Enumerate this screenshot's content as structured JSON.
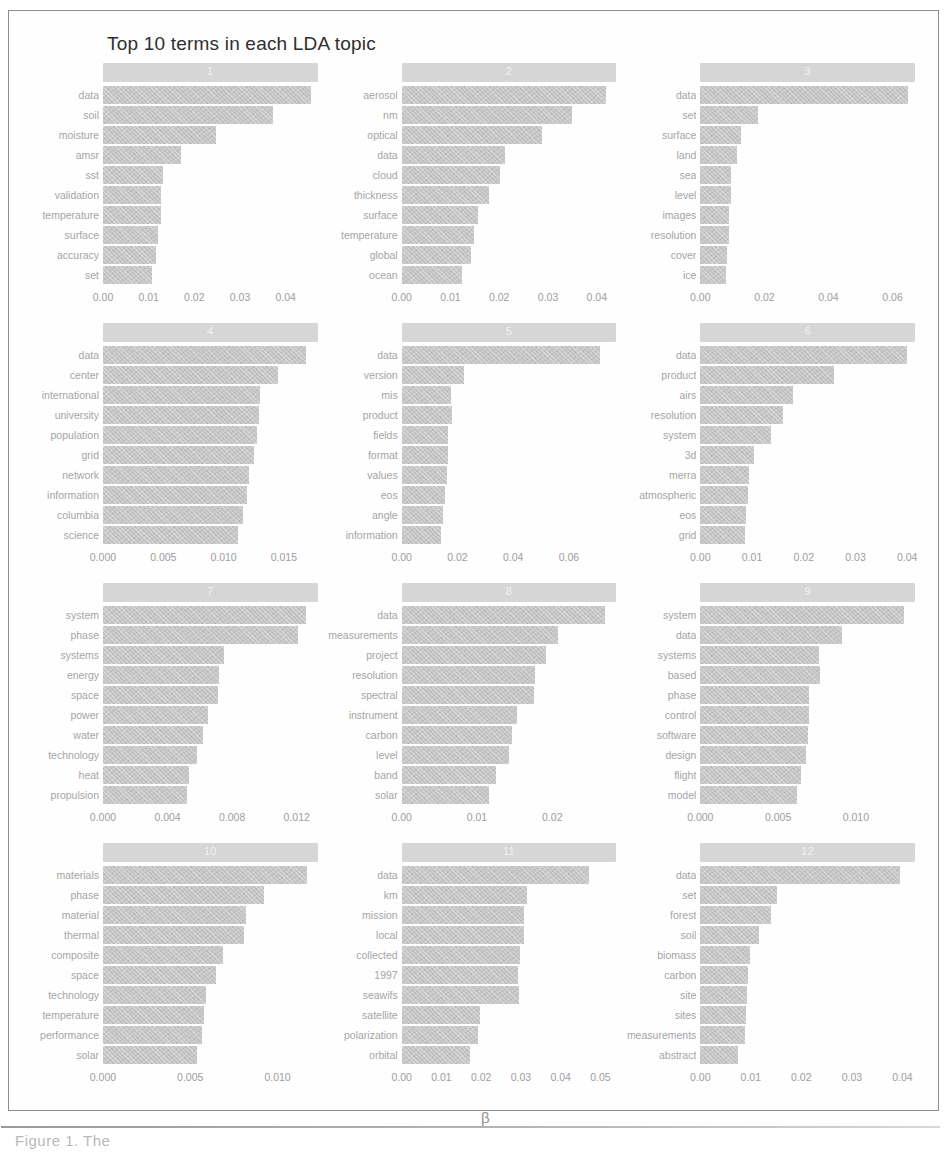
{
  "figure": {
    "title": "Top 10 terms in each LDA topic",
    "x_axis_label": "β",
    "caption_fragment": "Figure 1. The",
    "bar_color": "#c6c6c6",
    "strip_color": "#d6d6d6",
    "text_color": "#a5a5a5",
    "frame_color": "#8d8d8d"
  },
  "chart_data": {
    "type": "bar",
    "title": "Top 10 terms in each LDA topic",
    "xlabel": "β",
    "ylabel": "",
    "orientation": "horizontal",
    "grid": false,
    "legend": "none",
    "facets": [
      {
        "topic": "1",
        "xlim": [
          0,
          0.047
        ],
        "ticks": [
          "0.00",
          "0.01",
          "0.02",
          "0.03",
          "0.04"
        ],
        "tick_values": [
          0.0,
          0.01,
          0.02,
          0.03,
          0.04
        ],
        "categories": [
          "data",
          "soil",
          "moisture",
          "amsr",
          "sst",
          "validation",
          "temperature",
          "surface",
          "accuracy",
          "set"
        ],
        "values": [
          0.0455,
          0.0372,
          0.0248,
          0.017,
          0.0131,
          0.0128,
          0.0127,
          0.0121,
          0.0115,
          0.0107
        ]
      },
      {
        "topic": "2",
        "xlim": [
          0,
          0.044
        ],
        "ticks": [
          "0.00",
          "0.01",
          "0.02",
          "0.03",
          "0.04"
        ],
        "tick_values": [
          0.0,
          0.01,
          0.02,
          0.03,
          0.04
        ],
        "categories": [
          "aerosol",
          "nm",
          "optical",
          "data",
          "cloud",
          "thickness",
          "surface",
          "temperature",
          "global",
          "ocean"
        ],
        "values": [
          0.0418,
          0.0349,
          0.0288,
          0.0212,
          0.0202,
          0.0178,
          0.0156,
          0.0148,
          0.0143,
          0.0123
        ]
      },
      {
        "topic": "3",
        "xlim": [
          0,
          0.067
        ],
        "ticks": [
          "0.00",
          "0.02",
          "0.04",
          "0.06"
        ],
        "tick_values": [
          0.0,
          0.02,
          0.04,
          0.06
        ],
        "categories": [
          "data",
          "set",
          "surface",
          "land",
          "sea",
          "level",
          "images",
          "resolution",
          "cover",
          "ice"
        ],
        "values": [
          0.0648,
          0.018,
          0.0128,
          0.0116,
          0.0097,
          0.0095,
          0.0089,
          0.0089,
          0.0082,
          0.008
        ]
      },
      {
        "topic": "4",
        "xlim": [
          0,
          0.0178
        ],
        "ticks": [
          "0.000",
          "0.005",
          "0.010",
          "0.015"
        ],
        "tick_values": [
          0.0,
          0.005,
          0.01,
          0.015
        ],
        "categories": [
          "data",
          "center",
          "international",
          "university",
          "population",
          "grid",
          "network",
          "information",
          "columbia",
          "science"
        ],
        "values": [
          0.0168,
          0.0145,
          0.013,
          0.0129,
          0.0128,
          0.0125,
          0.0121,
          0.0119,
          0.0116,
          0.0112
        ]
      },
      {
        "topic": "5",
        "xlim": [
          0,
          0.077
        ],
        "ticks": [
          "0.00",
          "0.02",
          "0.04",
          "0.06"
        ],
        "tick_values": [
          0.0,
          0.02,
          0.04,
          0.06
        ],
        "categories": [
          "data",
          "version",
          "mis",
          "product",
          "fields",
          "format",
          "values",
          "eos",
          "angle",
          "information"
        ],
        "values": [
          0.0712,
          0.0222,
          0.0177,
          0.0181,
          0.0167,
          0.0165,
          0.0162,
          0.0155,
          0.0149,
          0.0141
        ]
      },
      {
        "topic": "6",
        "xlim": [
          0,
          0.0415
        ],
        "ticks": [
          "0.00",
          "0.01",
          "0.02",
          "0.03",
          "0.04"
        ],
        "tick_values": [
          0.0,
          0.01,
          0.02,
          0.03,
          0.04
        ],
        "categories": [
          "data",
          "product",
          "airs",
          "resolution",
          "system",
          "3d",
          "merra",
          "atmospheric",
          "eos",
          "grid"
        ],
        "values": [
          0.04,
          0.0258,
          0.0179,
          0.016,
          0.0137,
          0.0103,
          0.0094,
          0.0093,
          0.0088,
          0.0087
        ]
      },
      {
        "topic": "7",
        "xlim": [
          0,
          0.0133
        ],
        "ticks": [
          "0.000",
          "0.004",
          "0.008",
          "0.012"
        ],
        "tick_values": [
          0.0,
          0.004,
          0.008,
          0.012
        ],
        "categories": [
          "system",
          "phase",
          "systems",
          "energy",
          "space",
          "power",
          "water",
          "technology",
          "heat",
          "propulsion"
        ],
        "values": [
          0.0126,
          0.0121,
          0.0075,
          0.0072,
          0.0071,
          0.0065,
          0.0062,
          0.0058,
          0.0053,
          0.0052
        ]
      },
      {
        "topic": "8",
        "xlim": [
          0,
          0.0285
        ],
        "ticks": [
          "0.00",
          "0.01",
          "0.02"
        ],
        "tick_values": [
          0.0,
          0.01,
          0.02
        ],
        "categories": [
          "data",
          "measurements",
          "project",
          "resolution",
          "spectral",
          "instrument",
          "carbon",
          "level",
          "band",
          "solar"
        ],
        "values": [
          0.027,
          0.0208,
          0.0191,
          0.0177,
          0.0176,
          0.0153,
          0.0147,
          0.0143,
          0.0125,
          0.0116
        ]
      },
      {
        "topic": "9",
        "xlim": [
          0,
          0.0138
        ],
        "ticks": [
          "0.000",
          "0.005",
          "0.010"
        ],
        "tick_values": [
          0.0,
          0.005,
          0.01
        ],
        "categories": [
          "system",
          "data",
          "systems",
          "based",
          "phase",
          "control",
          "software",
          "design",
          "flight",
          "model"
        ],
        "values": [
          0.0131,
          0.0091,
          0.0076,
          0.0077,
          0.007,
          0.007,
          0.0069,
          0.0068,
          0.0065,
          0.0062
        ]
      },
      {
        "topic": "10",
        "xlim": [
          0,
          0.0123
        ],
        "ticks": [
          "0.000",
          "0.005",
          "0.010"
        ],
        "tick_values": [
          0.0,
          0.005,
          0.01
        ],
        "categories": [
          "materials",
          "phase",
          "material",
          "thermal",
          "composite",
          "space",
          "technology",
          "temperature",
          "performance",
          "solar"
        ],
        "values": [
          0.0117,
          0.0092,
          0.0082,
          0.0081,
          0.0069,
          0.0065,
          0.0059,
          0.0058,
          0.0057,
          0.0054
        ]
      },
      {
        "topic": "11",
        "xlim": [
          0,
          0.054
        ],
        "ticks": [
          "0.00",
          "0.01",
          "0.02",
          "0.03",
          "0.04",
          "0.05"
        ],
        "tick_values": [
          0.0,
          0.01,
          0.02,
          0.03,
          0.04,
          0.05
        ],
        "categories": [
          "data",
          "km",
          "mission",
          "local",
          "collected",
          "1997",
          "seawifs",
          "satellite",
          "polarization",
          "orbital"
        ],
        "values": [
          0.0472,
          0.0315,
          0.0309,
          0.0309,
          0.0297,
          0.0293,
          0.0294,
          0.0197,
          0.0193,
          0.0172
        ]
      },
      {
        "topic": "12",
        "xlim": [
          0,
          0.0425
        ],
        "ticks": [
          "0.00",
          "0.01",
          "0.02",
          "0.03",
          "0.04"
        ],
        "tick_values": [
          0.0,
          0.01,
          0.02,
          0.03,
          0.04
        ],
        "categories": [
          "data",
          "set",
          "forest",
          "soil",
          "biomass",
          "carbon",
          "site",
          "sites",
          "measurements",
          "abstract"
        ],
        "values": [
          0.0395,
          0.0151,
          0.014,
          0.0116,
          0.0098,
          0.0094,
          0.0093,
          0.009,
          0.0089,
          0.0075
        ]
      }
    ]
  }
}
